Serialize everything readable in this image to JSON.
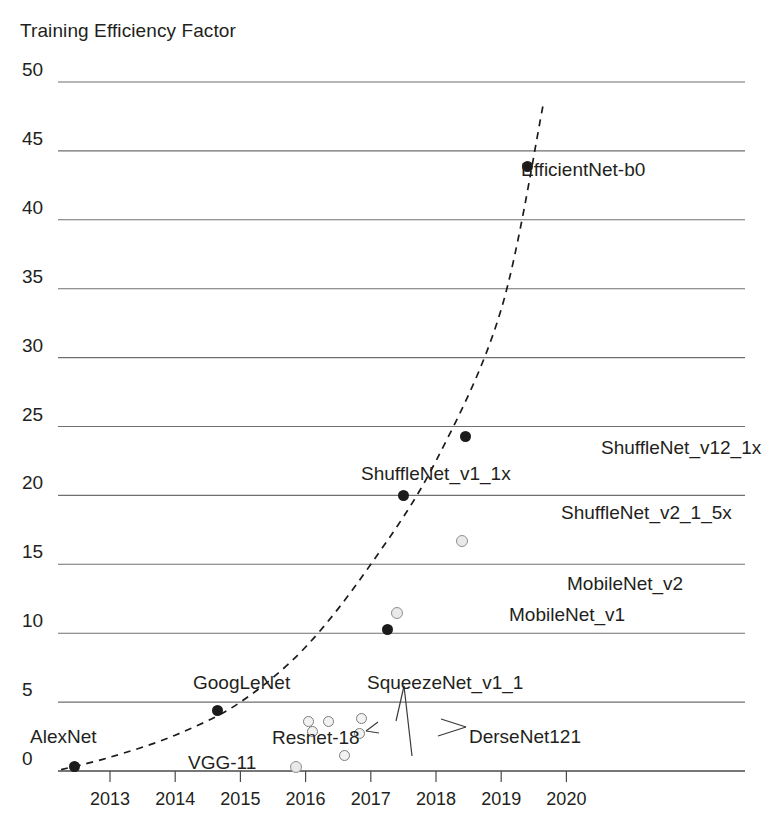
{
  "chart_data": {
    "type": "scatter",
    "title": "Training Efficiency Factor",
    "xlabel": "",
    "ylabel": "",
    "xlim": [
      2012.3,
      2020.2
    ],
    "ylim": [
      0,
      50
    ],
    "grid": true,
    "legend": "none",
    "y_ticks": [
      50,
      45,
      40,
      35,
      30,
      25,
      20,
      15,
      10,
      5,
      0
    ],
    "x_ticks": [
      2013,
      2014,
      2015,
      2016,
      2017,
      2018,
      2019,
      2020
    ],
    "annotations": [
      {
        "text": "SqueezeNet_v1_1 has two leader lines pointing to two hollow markers"
      },
      {
        "text": "Resnet-18 label points to two stacked hollow markers"
      },
      {
        "text": "DerseNet121 label points to two hollow markers"
      }
    ],
    "series": [
      {
        "name": "filled-markers",
        "marker": "filled-circle",
        "color": "#1b1b1b",
        "points": [
          {
            "label": "AlexNet",
            "x": 2012.45,
            "y": 0.3
          },
          {
            "label": "GoogLeNet",
            "x": 2014.65,
            "y": 4.4
          },
          {
            "label": "MobileNet_v1",
            "x": 2017.25,
            "y": 10.3
          },
          {
            "label": "ShuffleNet_v1_1x",
            "x": 2017.5,
            "y": 20.0
          },
          {
            "label": "ShuffleNet_v12_1x",
            "x": 2018.45,
            "y": 24.3
          },
          {
            "label": "EfficientNet-b0",
            "x": 2019.4,
            "y": 43.9
          }
        ]
      },
      {
        "name": "hollow-markers",
        "marker": "hollow-circle",
        "color": "#8f8f8f",
        "points": [
          {
            "label": "VGG-11",
            "x": 2015.85,
            "y": 0.3
          },
          {
            "label": "Resnet-18 (a)",
            "x": 2016.05,
            "y": 3.6
          },
          {
            "label": "Resnet-18 (b)",
            "x": 2016.1,
            "y": 2.9
          },
          {
            "label": "SqueezeNet_v1_1 (a)",
            "x": 2016.35,
            "y": 3.6
          },
          {
            "label": "SqueezeNet_v1_1 (b)",
            "x": 2016.6,
            "y": 1.1
          },
          {
            "label": "DerseNet121 (a)",
            "x": 2016.85,
            "y": 3.8
          },
          {
            "label": "DerseNet121 (b)",
            "x": 2016.82,
            "y": 2.7
          },
          {
            "label": "MobileNet_v2",
            "x": 2017.4,
            "y": 11.5
          },
          {
            "label": "ShuffleNet_v2_1_5x",
            "x": 2018.4,
            "y": 16.7
          }
        ]
      }
    ],
    "trend": {
      "name": "exponential-trend",
      "style": "dashed",
      "color": "#1b1b1b",
      "points": [
        {
          "x": 2012.25,
          "y": 0.1
        },
        {
          "x": 2013.0,
          "y": 1.0
        },
        {
          "x": 2014.0,
          "y": 2.6
        },
        {
          "x": 2015.0,
          "y": 5.0
        },
        {
          "x": 2016.0,
          "y": 9.0
        },
        {
          "x": 2017.0,
          "y": 15.0
        },
        {
          "x": 2018.0,
          "y": 22.5
        },
        {
          "x": 2019.0,
          "y": 33.5
        },
        {
          "x": 2019.65,
          "y": 48.5
        }
      ]
    },
    "labels": [
      {
        "text": "EfficientNet-b0",
        "x": 521,
        "y": 160,
        "anchor": "left"
      },
      {
        "text": "ShuffleNet_v12_1x",
        "x": 601,
        "y": 438,
        "anchor": "left"
      },
      {
        "text": "ShuffleNet_v1_1x",
        "x": 361,
        "y": 464,
        "anchor": "left"
      },
      {
        "text": "ShuffleNet_v2_1_5x",
        "x": 561,
        "y": 503,
        "anchor": "left"
      },
      {
        "text": "MobileNet_v2",
        "x": 567,
        "y": 574,
        "anchor": "left"
      },
      {
        "text": "MobileNet_v1",
        "x": 509,
        "y": 605,
        "anchor": "left"
      },
      {
        "text": "GoogLeNet",
        "x": 193,
        "y": 673,
        "anchor": "left"
      },
      {
        "text": "SqueezeNet_v1_1",
        "x": 367,
        "y": 673,
        "anchor": "left"
      },
      {
        "text": "AlexNet",
        "x": 30,
        "y": 727,
        "anchor": "left"
      },
      {
        "text": "Resnet-18",
        "x": 272,
        "y": 728,
        "anchor": "left"
      },
      {
        "text": "DerseNet121",
        "x": 469,
        "y": 727,
        "anchor": "left"
      },
      {
        "text": "VGG-11",
        "x": 188,
        "y": 753,
        "anchor": "left"
      }
    ]
  }
}
